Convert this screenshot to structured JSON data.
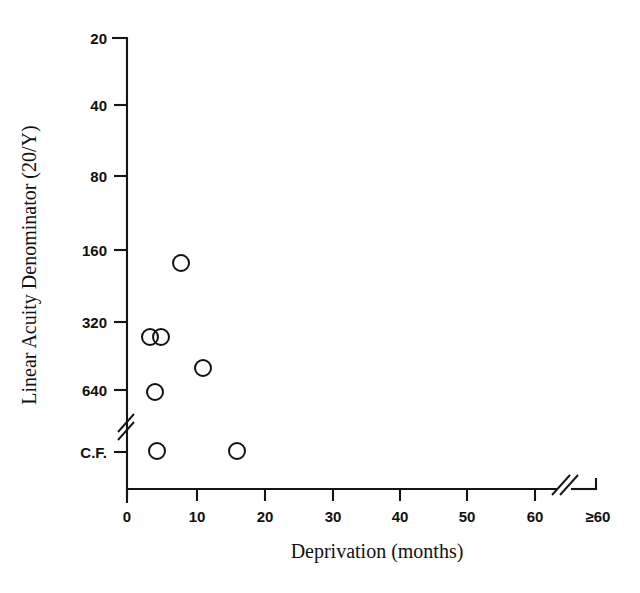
{
  "chart_data": {
    "type": "scatter",
    "title": "",
    "xlabel": "Deprivation (months)",
    "ylabel": "Linear Acuity Denominator (20/Y)",
    "grid": false,
    "legend": "none",
    "x_ticks": [
      "0",
      "10",
      "20",
      "30",
      "40",
      "50",
      "60",
      "≥60"
    ],
    "x_tick_values": [
      0,
      10,
      20,
      30,
      40,
      50,
      60,
      65
    ],
    "y_ticks": [
      "20",
      "40",
      "80",
      "160",
      "320",
      "640",
      "C.F."
    ],
    "y_tick_values": [
      20,
      40,
      80,
      160,
      320,
      640,
      1280
    ],
    "y_scale": "log2-descending",
    "xlim": [
      0,
      65
    ],
    "x_axis_break": true,
    "x_axis_break_position": 63,
    "y_axis_break": true,
    "y_axis_break_between": [
      "640",
      "C.F."
    ],
    "marker": "open-circle",
    "marker_radius": 8,
    "points": [
      {
        "x": 7.0,
        "y_label": "200",
        "px": 181,
        "py": 263
      },
      {
        "x": 3.3,
        "y_label": "380",
        "px": 150,
        "py": 337
      },
      {
        "x": 4.9,
        "y_label": "380",
        "px": 161,
        "py": 337
      },
      {
        "x": 10.6,
        "y_label": "540",
        "px": 203,
        "py": 368
      },
      {
        "x": 4.0,
        "y_label": "690",
        "px": 155,
        "py": 392
      },
      {
        "x": 4.3,
        "y_label": "C.F.",
        "px": 157,
        "py": 451
      },
      {
        "x": 15.9,
        "y_label": "C.F.",
        "px": 237,
        "py": 451
      }
    ],
    "n_points": 7
  },
  "axes": {
    "x_tick_labels": [
      {
        "text": "0",
        "px": 127
      },
      {
        "text": "10",
        "px": 197
      },
      {
        "text": "20",
        "px": 265
      },
      {
        "text": "30",
        "px": 333
      },
      {
        "text": "40",
        "px": 400
      },
      {
        "text": "50",
        "px": 467
      },
      {
        "text": "60",
        "px": 535
      },
      {
        "text": "≥60",
        "px": 596
      }
    ],
    "y_tick_labels": [
      {
        "text": "20",
        "py": 38
      },
      {
        "text": "40",
        "py": 105
      },
      {
        "text": "80",
        "py": 176
      },
      {
        "text": "160",
        "py": 250
      },
      {
        "text": "320",
        "py": 322
      },
      {
        "text": "640",
        "py": 390
      },
      {
        "text": "C.F.",
        "py": 452
      }
    ],
    "x_title": "Deprivation (months)",
    "y_title": "Linear Acuity Denominator (20/Y)"
  }
}
